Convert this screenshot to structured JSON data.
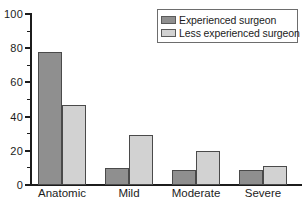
{
  "chart_data": {
    "type": "bar",
    "title": "",
    "subtitle": "",
    "xlabel": "",
    "ylabel": "",
    "categories": [
      "Anatomic",
      "Mild",
      "Moderate",
      "Severe"
    ],
    "series": [
      {
        "name": "Experienced surgeon",
        "color": "#8f8f8f",
        "values": [
          78,
          10,
          9,
          9
        ]
      },
      {
        "name": "Less experienced surgeon",
        "color": "#d2d2d2",
        "values": [
          47,
          29,
          20,
          11
        ]
      }
    ],
    "ylim": [
      0,
      100
    ],
    "y_major_ticks": [
      0,
      20,
      40,
      60,
      80,
      100
    ],
    "y_minor_ticks": [
      10,
      30,
      50,
      70,
      90
    ],
    "y_tick_labels": [
      "0",
      "20",
      "40",
      "60",
      "80",
      "100"
    ],
    "grid": false,
    "legend_position": "top-right",
    "legend_entries": [
      "Experienced surgeon",
      "Less experienced surgeon"
    ],
    "annotations": []
  }
}
